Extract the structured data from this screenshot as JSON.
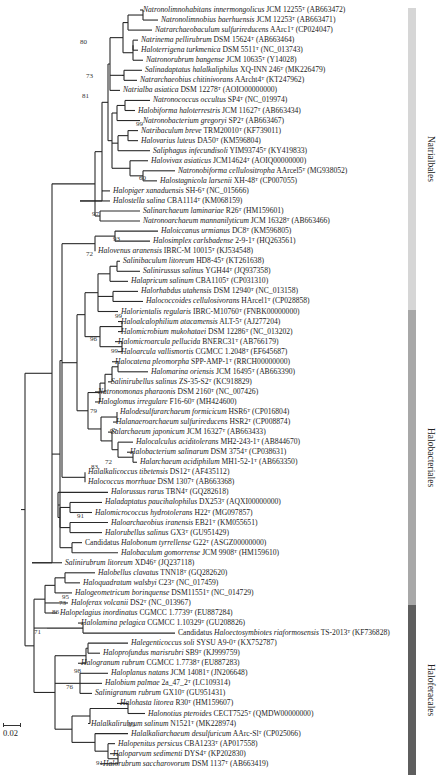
{
  "chart_data": {
    "type": "phylogenetic_tree",
    "scale_bar": "0.02",
    "leaves": [
      {
        "genus_species": "Natronolimnohabitans innermongolicus",
        "strain": "JCM 12255",
        "type_strain": true,
        "accession": "AB663472",
        "order": "Natrialbales"
      },
      {
        "genus_species": "Natronolimnobius baerhuensis",
        "strain": "JCM 12253",
        "type_strain": true,
        "accession": "AB663471",
        "order": "Natrialbales"
      },
      {
        "genus_species": "Natrarchaeobaculum sulfurireducens",
        "strain": "AArc1",
        "type_strain": true,
        "accession": "CP024047",
        "order": "Natrialbales"
      },
      {
        "genus_species": "Natrinema pellirubrum",
        "strain": "DSM 15624",
        "type_strain": true,
        "accession": "AB663464",
        "order": "Natrialbales"
      },
      {
        "genus_species": "Haloterrigena turkmenica",
        "strain": "DSM 5511",
        "type_strain": true,
        "accession": "NC_013743",
        "order": "Natrialbales"
      },
      {
        "genus_species": "Natronorubrum bangense",
        "strain": "JCM 10635",
        "type_strain": true,
        "accession": "Y14028",
        "order": "Natrialbales"
      },
      {
        "genus_species": "Salinadaptatus halalkaliphilus",
        "strain": "XQ-INN 246",
        "type_strain": true,
        "accession": "MK226479",
        "order": "Natrialbales"
      },
      {
        "genus_species": "Natrarchaeobius chitinivorans",
        "strain": "AArcht4",
        "type_strain": true,
        "accession": "KT247962",
        "order": "Natrialbales"
      },
      {
        "genus_species": "Natrialba asiatica",
        "strain": "DSM 12278",
        "type_strain": true,
        "accession": "AOIO00000000",
        "order": "Natrialbales"
      },
      {
        "genus_species": "Natronococcus occultus",
        "strain": "SP4",
        "type_strain": true,
        "accession": "NC_019974",
        "order": "Natrialbales"
      },
      {
        "genus_species": "Halobiforma haloterrestris",
        "strain": "JCM 11627",
        "type_strain": true,
        "accession": "AB663434",
        "order": "Natrialbales"
      },
      {
        "genus_species": "Natronobacterium gregoryi",
        "strain": "SP2",
        "type_strain": true,
        "accession": "AB663467",
        "order": "Natrialbales"
      },
      {
        "genus_species": "Natribaculum breve",
        "strain": "TRM20010",
        "type_strain": true,
        "accession": "KF739011",
        "order": "Natrialbales"
      },
      {
        "genus_species": "Halovarius luteus",
        "strain": "DA50",
        "type_strain": true,
        "accession": "KM596804",
        "order": "Natrialbales"
      },
      {
        "genus_species": "Saliphagus infecundisoli",
        "strain": "YIM93745",
        "type_strain": true,
        "accession": "KY419833",
        "order": "Natrialbales"
      },
      {
        "genus_species": "Halovivax asiaticus",
        "strain": "JCM14624",
        "type_strain": true,
        "accession": "AOIQ00000000",
        "order": "Natrialbales"
      },
      {
        "genus_species": "Natronobiforma cellulositropha",
        "strain": "AArcel5",
        "type_strain": true,
        "accession": "MG938052",
        "order": "Natrialbales"
      },
      {
        "genus_species": "Halostagnicola larsenii",
        "strain": "XH-48",
        "type_strain": true,
        "accession": "CP007055",
        "order": "Natrialbales"
      },
      {
        "genus_species": "Halopiger xanaduensis",
        "strain": "SH-6",
        "type_strain": true,
        "accession": "NC_015666",
        "order": "Natrialbales"
      },
      {
        "genus_species": "Halostella salina",
        "strain": "CBA1114",
        "type_strain": true,
        "accession": "KM068159",
        "order": "Natrialbales"
      },
      {
        "genus_species": "Salinarchaeum laminariae",
        "strain": "R26",
        "type_strain": true,
        "accession": "HM159601",
        "order": "Natrialbales"
      },
      {
        "genus_species": "Natronoarchaeum mannanilyticum",
        "strain": "JCM 16328",
        "type_strain": true,
        "accession": "AB663466",
        "order": "Natrialbales"
      },
      {
        "genus_species": "Haloiccanus urmianus",
        "strain": "DC8",
        "type_strain": true,
        "accession": "KM596805",
        "order": "Halobacteriales"
      },
      {
        "genus_species": "Halosimplex carlsbadense",
        "strain": "2-9-1",
        "type_strain": true,
        "accession": "HQ263561",
        "order": "Halobacteriales"
      },
      {
        "genus_species": "Halovenus aranensis",
        "strain": "IBRC-M 10015",
        "type_strain": true,
        "accession": "KJ534548",
        "order": "Halobacteriales"
      },
      {
        "genus_species": "Salinibaculum litoreum",
        "strain": "HD8-45",
        "type_strain": true,
        "accession": "KT261638",
        "order": "Halobacteriales"
      },
      {
        "genus_species": "Salinirussus salinus",
        "strain": "YGH44",
        "type_strain": true,
        "accession": "JQ937358",
        "order": "Halobacteriales"
      },
      {
        "genus_species": "Halapricum salinum",
        "strain": "CBA1105",
        "type_strain": true,
        "accession": "CP031310",
        "order": "Halobacteriales"
      },
      {
        "genus_species": "Halorhabdus utahensis",
        "strain": "DSM 12940",
        "type_strain": true,
        "accession": "NC_013158",
        "order": "Halobacteriales"
      },
      {
        "genus_species": "Halococcoides cellulosivorans",
        "strain": "HArcel1",
        "type_strain": true,
        "accession": "CP028858",
        "order": "Halobacteriales"
      },
      {
        "genus_species": "Halorientalis regularis",
        "strain": "IBRC-M10760",
        "type_strain": true,
        "accession": "FNBK00000000",
        "order": "Halobacteriales"
      },
      {
        "genus_species": "Haloalcalophilium atacamensis",
        "strain": "ALT-5",
        "type_strain": true,
        "accession": "AJ277204",
        "order": "Halobacteriales"
      },
      {
        "genus_species": "Halomicrobium mukohataei",
        "strain": "DSM 12286",
        "type_strain": true,
        "accession": "NC_013202",
        "order": "Halobacteriales"
      },
      {
        "genus_species": "Halomicroarcula pellucida",
        "strain": "BNERC31",
        "type_strain": true,
        "accession": "AB766179",
        "order": "Halobacteriales"
      },
      {
        "genus_species": "Haloarcula vallismortis",
        "strain": "CGMCC 1.2048",
        "type_strain": true,
        "accession": "EF645687",
        "order": "Halobacteriales"
      },
      {
        "genus_species": "Halocatena pleomorpha",
        "strain": "SPP-AMP-1",
        "type_strain": true,
        "accession": "RRCH00000000",
        "order": "Halobacteriales"
      },
      {
        "genus_species": "Halomarina oriensis",
        "strain": "JCM 16495",
        "type_strain": true,
        "accession": "AB663390",
        "order": "Halobacteriales"
      },
      {
        "genus_species": "Salinirubellus salinus",
        "strain": "ZS-35-S2",
        "type_strain": true,
        "accession": "KC918829",
        "order": "Halobacteriales"
      },
      {
        "genus_species": "Natronomonas pharaonis",
        "strain": "DSM 2160",
        "type_strain": true,
        "accession": "NC_007426",
        "order": "Halobacteriales"
      },
      {
        "genus_species": "Haloglomus irregulare",
        "strain": "F16-60",
        "type_strain": true,
        "accession": "MH424600",
        "order": "Halobacteriales"
      },
      {
        "genus_species": "Halodesulfurarchaeum formicicum",
        "strain": "HSR6",
        "type_strain": true,
        "accession": "CP016804",
        "order": "Halobacteriales"
      },
      {
        "genus_species": "Halanaeroarchaeum sulfurireducens",
        "strain": "HSR2",
        "type_strain": true,
        "accession": "CP008874",
        "order": "Halobacteriales"
      },
      {
        "genus_species": "Salarchaeum japonicum",
        "strain": "JCM 16327",
        "type_strain": true,
        "accession": "AB663433",
        "order": "Halobacteriales"
      },
      {
        "genus_species": "Halocalculus aciditolerans",
        "strain": "MH2-243-1",
        "type_strain": true,
        "accession": "AB844670",
        "order": "Halobacteriales"
      },
      {
        "genus_species": "Halobacterium salinarum",
        "strain": "DSM 3754",
        "type_strain": true,
        "accession": "CP038631",
        "order": "Halobacteriales"
      },
      {
        "genus_species": "Halarchaeum acidiphilum",
        "strain": "MH1-52-1",
        "type_strain": true,
        "accession": "AB663350",
        "order": "Halobacteriales"
      },
      {
        "genus_species": "Halalkalicoccus tibetensis",
        "strain": "DS12",
        "type_strain": true,
        "accession": "AF435112",
        "order": "Halobacteriales"
      },
      {
        "genus_species": "Halococcus morrhuae",
        "strain": "DSM 1307",
        "type_strain": true,
        "accession": "AB663368",
        "order": "Halobacteriales"
      },
      {
        "genus_species": "Halorussus rarus",
        "strain": "TBN4",
        "type_strain": true,
        "accession": "GQ282618",
        "order": "Halobacteriales"
      },
      {
        "genus_species": "Haladaptatus paucihalophilus",
        "strain": "DX253",
        "type_strain": true,
        "accession": "AQXI00000000",
        "order": "Halobacteriales"
      },
      {
        "genus_species": "Halomicrococcus hydrotolerans",
        "strain": "H22",
        "type_strain": true,
        "accession": "MG097857",
        "order": "Halobacteriales"
      },
      {
        "genus_species": "Haloarchaeobius iranensis",
        "strain": "EB21",
        "type_strain": true,
        "accession": "KM055651",
        "order": "Halobacteriales"
      },
      {
        "genus_species": "Halorubellus salinus",
        "strain": "GX3",
        "type_strain": true,
        "accession": "GU951429",
        "order": "Halobacteriales"
      },
      {
        "genus_species": "Candidatus Halobonum tyrrellense",
        "strain": "G22",
        "type_strain": true,
        "accession": "ASGZ00000000",
        "order": "Halobacteriales"
      },
      {
        "genus_species": "Halobaculum gomorrense",
        "strain": "JCM 9908",
        "type_strain": true,
        "accession": "HM159610",
        "order": "Halobacteriales"
      },
      {
        "genus_species": "Salinirubrum litoreum",
        "strain": "XD46",
        "type_strain": true,
        "accession": "JQ237118",
        "order": "Halobacteriales"
      },
      {
        "genus_species": "Halobellus clavatus",
        "strain": "TNN18",
        "type_strain": true,
        "accession": "GQ282620",
        "order": "Haloferacales"
      },
      {
        "genus_species": "Haloquadratum walsbyi",
        "strain": "C23",
        "type_strain": true,
        "accession": "NC_017459",
        "order": "Haloferacales"
      },
      {
        "genus_species": "Halogeometricum borinquense",
        "strain": "DSM11551",
        "type_strain": true,
        "accession": "NC_014729",
        "order": "Haloferacales"
      },
      {
        "genus_species": "Haloferax volcanii",
        "strain": "DS2",
        "type_strain": true,
        "accession": "NC_013967",
        "order": "Haloferacales"
      },
      {
        "genus_species": "Halopelagius inordinatus",
        "strain": "CGMCC 1.7739",
        "type_strain": true,
        "accession": "EU887284",
        "order": "Haloferacales"
      },
      {
        "genus_species": "Halolamina pelagica",
        "strain": "CGMCC 1.10329",
        "type_strain": true,
        "accession": "GU208826",
        "order": "Haloferacales"
      },
      {
        "genus_species": "Candidatus Haloectosymbiotes riaformosensis",
        "strain": "TS-2013",
        "type_strain": true,
        "accession": "KF736828",
        "order": "Haloferacales"
      },
      {
        "genus_species": "Halegenticoccus soli",
        "strain": "SYSU A9-0",
        "type_strain": true,
        "accession": "KX752787",
        "order": "Haloferacales"
      },
      {
        "genus_species": "Haloprofundus marisrubri",
        "strain": "SB9",
        "type_strain": true,
        "accession": "KJ999759",
        "order": "Haloferacales"
      },
      {
        "genus_species": "Halogranum rubrum",
        "strain": "CGMCC 1.7738",
        "type_strain": true,
        "accession": "EU887283",
        "order": "Haloferacales"
      },
      {
        "genus_species": "Haloplanus natans",
        "strain": "JCM 14081",
        "type_strain": true,
        "accession": "JN206648",
        "order": "Haloferacales"
      },
      {
        "genus_species": "Halobium palmae",
        "strain": "2a_47_2",
        "type_strain": true,
        "accession": "LC109314",
        "order": "Haloferacales"
      },
      {
        "genus_species": "Salinigranum rubrum",
        "strain": "GX10",
        "type_strain": true,
        "accession": "GU951431",
        "order": "Haloferacales"
      },
      {
        "genus_species": "Halohasta litorea",
        "strain": "R30",
        "type_strain": true,
        "accession": "HM159607",
        "order": "Haloferacales"
      },
      {
        "genus_species": "Halonotius pteroides",
        "strain": "CECT7525",
        "type_strain": true,
        "accession": "QMDW00000000",
        "order": "Haloferacales"
      },
      {
        "genus_species": "Halalkalirubrum salinum",
        "strain": "N1521",
        "type_strain": true,
        "accession": "MK228974",
        "order": "Haloferacales"
      },
      {
        "genus_species": "Halalkaliarchaeum desulfuricum",
        "strain": "AArc-Sl",
        "type_strain": true,
        "accession": "CP025066",
        "order": "Haloferacales"
      },
      {
        "genus_species": "Halopenitus persicus",
        "strain": "CBA1233",
        "type_strain": true,
        "accession": "AP017558",
        "order": "Haloferacales"
      },
      {
        "genus_species": "Haloparvum sedimenti",
        "strain": "DYS4",
        "type_strain": true,
        "accession": "KP202830",
        "order": "Haloferacales"
      },
      {
        "genus_species": "Halorubrum saccharovorum",
        "strain": "DSM 1137",
        "type_strain": true,
        "accession": "AB663419",
        "order": "Haloferacales"
      }
    ],
    "bootstrap_values": [
      "80",
      "73",
      "81",
      "99",
      "60",
      "97",
      "93",
      "72",
      "99",
      "96",
      "99",
      "79",
      "97",
      "83",
      "72",
      "91",
      "95",
      "73",
      "86",
      "71",
      "98",
      "76",
      "99",
      "91"
    ],
    "orders": [
      {
        "name": "Natrialbales",
        "color": "#d6d6d6",
        "top": 8,
        "bottom": 310
      },
      {
        "name": "Halobacteriales",
        "color": "#a8a8a8",
        "top": 310,
        "bottom": 605
      },
      {
        "name": "Haloferacales",
        "color": "#5e5e5e",
        "top": 605,
        "bottom": 775
      }
    ]
  }
}
